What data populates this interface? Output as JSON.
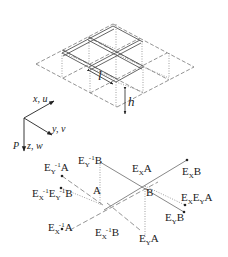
{
  "figure": {
    "type": "isometric-lattice-diagram",
    "top_panel": {
      "description": "3x3 isometric grid (two stacked layers connected by vertical dotted struts)",
      "dimension_labels": {
        "spacing": "l",
        "height": "h"
      }
    },
    "axes": {
      "x": "x, u",
      "y": "y, v",
      "z": "z, w",
      "load": "P"
    },
    "bottom_panel": {
      "center_labels": {
        "A": "A",
        "B": "B"
      },
      "operators": [
        {
          "id": "ey_inv_a",
          "base": "E",
          "sub": "Y",
          "sup": "-1",
          "arg": "A"
        },
        {
          "id": "ey_inv_b",
          "base": "E",
          "sub": "Y",
          "sup": "-1",
          "arg": "B"
        },
        {
          "id": "ex_inv_ey_inv_b",
          "base": "E",
          "sub": "X",
          "sup": "-1",
          "base2": "E",
          "sub2": "Y",
          "sup2": "-1",
          "arg": "B"
        },
        {
          "id": "ex_inv_a",
          "base": "E",
          "sub": "X",
          "sup": "-1",
          "arg": "A"
        },
        {
          "id": "ex_inv_b",
          "base": "E",
          "sub": "X",
          "sup": "-1",
          "arg": "B"
        },
        {
          "id": "ex_a",
          "base": "E",
          "sub": "X",
          "arg": "A"
        },
        {
          "id": "ex_b",
          "base": "E",
          "sub": "X",
          "arg": "B"
        },
        {
          "id": "ex_ey_a",
          "base": "E",
          "sub": "X",
          "base2": "E",
          "sub2": "Y",
          "arg": "A"
        },
        {
          "id": "ey_b",
          "base": "E",
          "sub": "Y",
          "arg": "B"
        },
        {
          "id": "ey_a",
          "base": "E",
          "sub": "Y",
          "arg": "A"
        }
      ]
    },
    "colors": {
      "line": "#555555",
      "text": "#222222",
      "background": "#ffffff"
    }
  }
}
